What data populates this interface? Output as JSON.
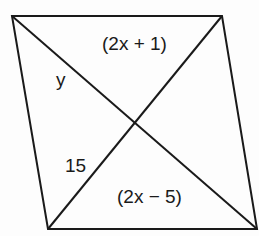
{
  "diagram": {
    "shape": "parallelogram",
    "vertices": {
      "top_left": [
        12,
        16
      ],
      "top_right": [
        222,
        16
      ],
      "bottom_right": [
        257,
        229
      ],
      "bottom_left": [
        48,
        229
      ]
    },
    "diagonals": [
      {
        "from": "top_left",
        "to": "bottom_right"
      },
      {
        "from": "top_right",
        "to": "bottom_left"
      }
    ],
    "stroke_color": "#1a1a1a",
    "labels": {
      "upper_right_segment": "(2x + 1)",
      "upper_left_segment": "y",
      "lower_left_segment": "15",
      "lower_right_segment": "(2x − 5)"
    }
  }
}
